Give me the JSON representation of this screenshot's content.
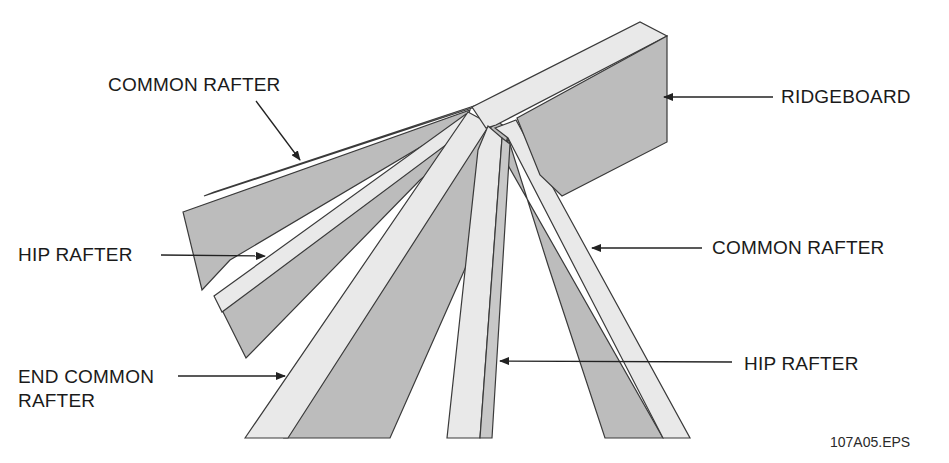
{
  "figure": {
    "id": "107A05.EPS",
    "colors": {
      "face_dark": "#bcbcbc",
      "face_light": "#e9e9e9",
      "edge": "#3a3a3a",
      "text": "#1a1a1a"
    }
  },
  "labels": {
    "common_rafter_top": "COMMON RAFTER",
    "ridgeboard": "RIDGEBOARD",
    "hip_rafter_left": "HIP RAFTER",
    "common_rafter_right": "COMMON RAFTER",
    "end_common_rafter_line1": "END COMMON",
    "end_common_rafter_line2": "RAFTER",
    "hip_rafter_bottom": "HIP RAFTER"
  }
}
